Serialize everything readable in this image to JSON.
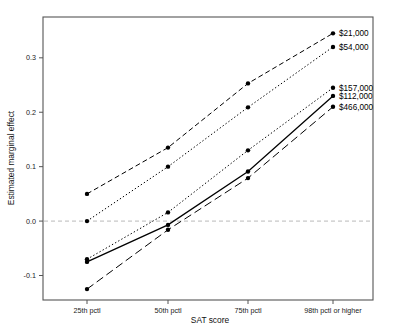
{
  "chart_data": {
    "type": "line",
    "title": "",
    "xlabel": "SAT score",
    "ylabel": "Estimated marginal effect",
    "categories": [
      "25th pctl",
      "50th pctl",
      "75th pctl",
      "98th pctl or higher"
    ],
    "ytick_labels": [
      "-0.1",
      "0.0",
      "0.1",
      "0.2",
      "0.3"
    ],
    "ytick_values": [
      -0.1,
      0.0,
      0.1,
      0.2,
      0.3
    ],
    "ylim": [
      -0.145,
      0.375
    ],
    "grid": false,
    "zero_reference_line": 0.0,
    "legend_position": "right-inline-labels",
    "marker": "filled-circle",
    "series": [
      {
        "name": "$21,000",
        "label": "$21,000",
        "style": "dashed",
        "color": "#000000",
        "values": [
          0.05,
          0.135,
          0.253,
          0.345
        ]
      },
      {
        "name": "$54,000",
        "label": "$54,000",
        "style": "dotted",
        "color": "#000000",
        "values": [
          0.0,
          0.1,
          0.209,
          0.32
        ]
      },
      {
        "name": "$157,000",
        "label": "$157,000",
        "style": "dotted",
        "color": "#000000",
        "values": [
          -0.07,
          0.016,
          0.13,
          0.245
        ]
      },
      {
        "name": "$112,000",
        "label": "$112,000",
        "style": "solid",
        "color": "#000000",
        "values": [
          -0.075,
          -0.007,
          0.091,
          0.23
        ]
      },
      {
        "name": "$466,000",
        "label": "$466,000",
        "style": "long-dash",
        "color": "#000000",
        "values": [
          -0.125,
          -0.016,
          0.079,
          0.21
        ]
      }
    ]
  },
  "axis": {
    "y_title": "Estimated marginal effect",
    "x_title": "SAT score"
  },
  "colors": {
    "ink": "#000000",
    "frame": "#555555",
    "zero_line": "#b9b9b9",
    "background": "#ffffff"
  }
}
